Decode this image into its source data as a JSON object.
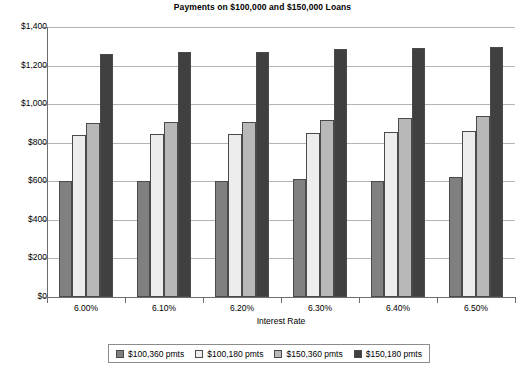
{
  "chart_data": {
    "type": "bar",
    "title": "Payments on $100,000 and $150,000 Loans",
    "xlabel": "Interest Rate",
    "ylabel": "",
    "categories": [
      "6.00%",
      "6.10%",
      "6.20%",
      "6.30%",
      "6.40%",
      "6.50%"
    ],
    "ylim": [
      0,
      1400
    ],
    "ytick_values": [
      0,
      200,
      400,
      600,
      800,
      1000,
      1200,
      1400
    ],
    "ytick_labels": [
      "$0",
      "$200",
      "$400",
      "$600",
      "$800",
      "$1,000",
      "$1,200",
      "$1,400"
    ],
    "grid": true,
    "legend_position": "bottom",
    "series": [
      {
        "name": "$100,360 pmts",
        "color": "#808080",
        "values": [
          600,
          602,
          604,
          614,
          600,
          620
        ]
      },
      {
        "name": "$100,180 pmts",
        "color": "#ededed",
        "values": [
          840,
          845,
          845,
          848,
          855,
          860
        ]
      },
      {
        "name": "$150,360 pmts",
        "color": "#b8b8b8",
        "values": [
          900,
          905,
          905,
          918,
          930,
          938
        ]
      },
      {
        "name": "$150,180 pmts",
        "color": "#404040",
        "values": [
          1260,
          1268,
          1270,
          1286,
          1290,
          1296
        ]
      }
    ]
  }
}
